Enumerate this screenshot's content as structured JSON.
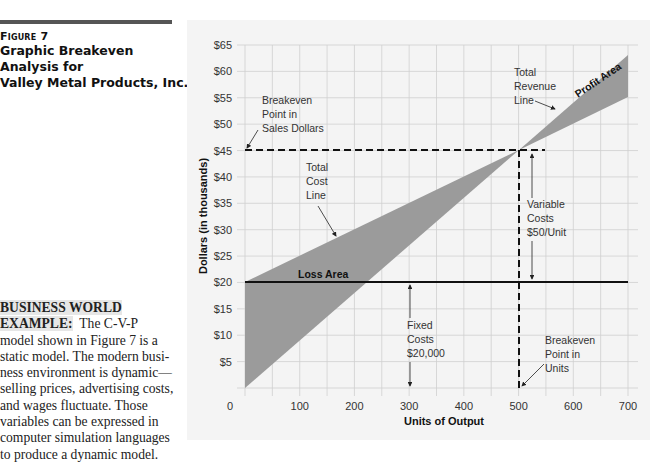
{
  "figure": {
    "label": "Figure 7",
    "title_line1": "Graphic Breakeven Analysis for",
    "title_line2": "Valley Metal Products, Inc."
  },
  "sidebar": {
    "heading_line1": "BUSINESS WORLD",
    "heading_line2": "EXAMPLE:",
    "text_first": "The C-V-P",
    "lines": [
      "model shown in Figure 7 is a",
      "static model. The modern busi-",
      "ness environment is dynamic—",
      "selling prices, advertising costs,",
      "and wages fluctuate. Those",
      "variables can be expressed in",
      "computer simulation languages",
      "to produce a dynamic model."
    ]
  },
  "chart_data": {
    "type": "line",
    "title": "Graphic Breakeven Analysis for Valley Metal Products, Inc.",
    "xlabel": "Units of Output",
    "ylabel": "Dollars (in thousands)",
    "xlim": [
      0,
      700
    ],
    "ylim": [
      0,
      65
    ],
    "grid": true,
    "x_ticks": [
      "0",
      "100",
      "200",
      "300",
      "400",
      "500",
      "600",
      "700"
    ],
    "y_ticks": [
      "$5",
      "$10",
      "$15",
      "$20",
      "$25",
      "$30",
      "$35",
      "$40",
      "$45",
      "$50",
      "$55",
      "$60",
      "$65"
    ],
    "series": [
      {
        "name": "Total Revenue Line",
        "x": [
          0,
          700
        ],
        "y": [
          0,
          63
        ]
      },
      {
        "name": "Total Cost Line",
        "x": [
          0,
          700
        ],
        "y": [
          20,
          55
        ]
      },
      {
        "name": "Fixed Costs",
        "x": [
          0,
          700
        ],
        "y": [
          20,
          20
        ]
      }
    ],
    "breakeven": {
      "units": 500,
      "dollars_thousands": 45
    },
    "annotations": {
      "breakeven_dollars": [
        "Breakeven",
        "Point in",
        "Sales Dollars"
      ],
      "total_cost": [
        "Total",
        "Cost",
        "Line"
      ],
      "total_revenue": [
        "Total",
        "Revenue",
        "Line"
      ],
      "profit_area": "Profit Area",
      "loss_area": "Loss Area",
      "variable_costs": [
        "Variable",
        "Costs",
        "$50/Unit"
      ],
      "fixed_costs": [
        "Fixed",
        "Costs",
        "$20,000"
      ],
      "breakeven_units": [
        "Breakeven",
        "Point in",
        "Units"
      ]
    },
    "colors": {
      "shade": "#9b9b9b",
      "grid": "#cfcfcf",
      "panel": "#f4f4f4"
    }
  }
}
